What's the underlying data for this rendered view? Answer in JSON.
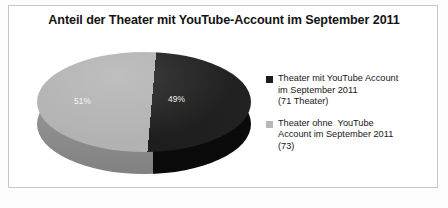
{
  "chart_data": {
    "type": "pie",
    "title": "Anteil der Theater mit YouTube-Account im September 2011",
    "categories": [
      "Theater mit YouTube Account im September 2011 (71 Theater)",
      "Theater ohne  YouTube Account im September 2011 (73)"
    ],
    "values": [
      49,
      51
    ],
    "counts": [
      71,
      73
    ],
    "value_labels": [
      "49%",
      "51%"
    ],
    "unit": "%",
    "xlabel": "",
    "ylabel": "",
    "legend_position": "right",
    "grid": false,
    "three_d": true,
    "colors": {
      "slice_dark": "#1d1d1d",
      "slice_light": "#b2b2b2",
      "frame_border": "#c8c8c8",
      "background": "#ffffff",
      "title_text": "#141414",
      "label_text": "#f2f2f2"
    },
    "legend": [
      {
        "label": "Theater mit YouTube Account\nim September 2011\n(71 Theater)",
        "swatch": "#1b1b1b",
        "value_label": "49%"
      },
      {
        "label": "Theater ohne  YouTube\nAccount im September 2011\n(73)",
        "swatch": "#b8b8b8",
        "value_label": "51%"
      }
    ]
  }
}
